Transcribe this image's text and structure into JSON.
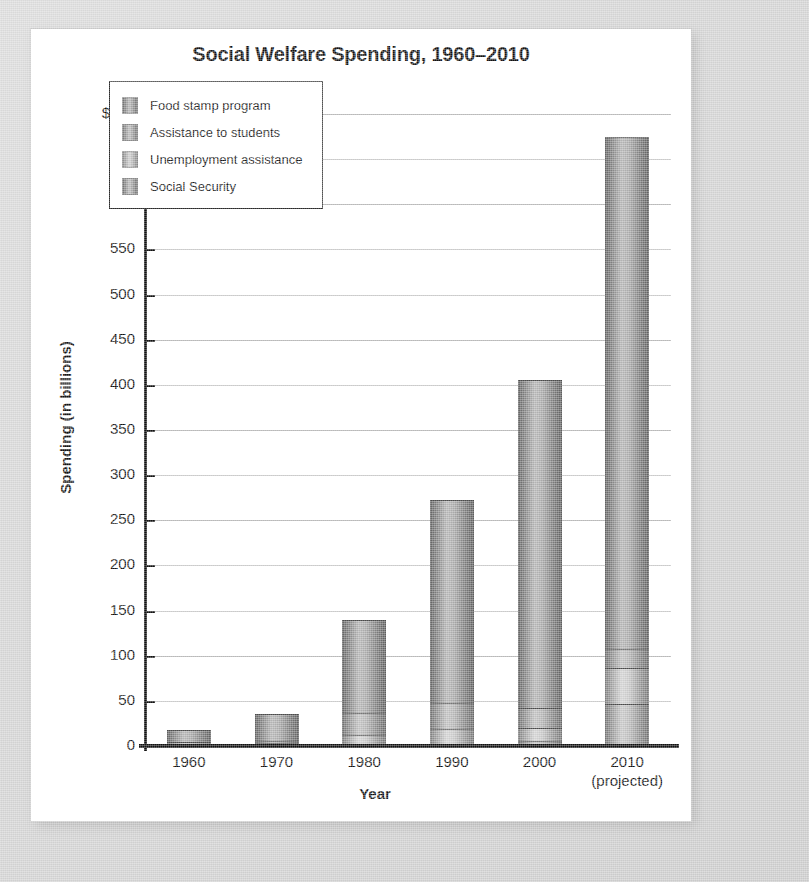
{
  "chart_data": {
    "type": "bar",
    "subtype": "stacked-bar",
    "title": "Social Welfare Spending, 1960–2010",
    "xlabel": "Year",
    "ylabel": "Spending (in billions)",
    "categories": [
      "1960",
      "1970",
      "1980",
      "1990",
      "2000",
      "2010"
    ],
    "category_sublabels": [
      "",
      "",
      "",
      "",
      "",
      "(projected)"
    ],
    "yticks": [
      "0",
      "50",
      "100",
      "150",
      "200",
      "250",
      "300",
      "350",
      "400",
      "450",
      "500",
      "550",
      "600",
      "650",
      "$700"
    ],
    "ytick_values": [
      0,
      50,
      100,
      150,
      200,
      250,
      300,
      350,
      400,
      450,
      500,
      550,
      600,
      650,
      700
    ],
    "ylim": [
      0,
      700
    ],
    "grid": true,
    "legend_position": "upper-left-inside",
    "series": [
      {
        "name": "Social Security",
        "color": "#9a9a9a",
        "values": [
          14,
          30,
          103,
          224,
          363,
          567
        ]
      },
      {
        "name": "Unemployment assistance",
        "color": "#b4b4b4",
        "values": [
          2,
          3,
          25,
          29,
          22,
          22
        ]
      },
      {
        "name": "Assistance to students",
        "color": "#8f8f8f",
        "values": [
          1,
          2,
          11,
          18,
          14,
          39
        ]
      },
      {
        "name": "Food stamp program",
        "color": "#7a7a7a",
        "values": [
          1,
          1,
          1,
          1,
          6,
          47
        ]
      }
    ],
    "totals": [
      18,
      36,
      140,
      272,
      405,
      675
    ]
  },
  "legend": {
    "items": [
      {
        "label": "Food stamp program"
      },
      {
        "label": "Assistance to students"
      },
      {
        "label": "Unemployment assistance"
      },
      {
        "label": "Social Security"
      }
    ]
  },
  "colors": {
    "page_background": "#d4d4d4",
    "card_background": "#ffffff",
    "axis": "#111111",
    "gridline": "#b9b9b9",
    "text": "#111111"
  }
}
